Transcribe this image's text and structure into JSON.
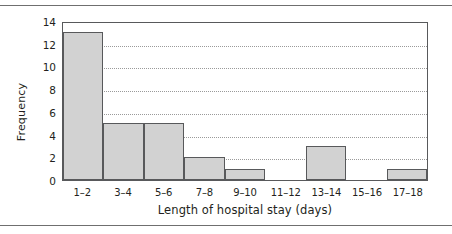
{
  "figure": {
    "background": "#ffffff",
    "rules": {
      "top": "#6f6f6f",
      "bottom": "#6f6f6f"
    }
  },
  "chart_data": {
    "type": "bar",
    "title": "",
    "subtitle": "",
    "xlabel": "Length of hospital stay (days)",
    "ylabel": "Frequency",
    "categories": [
      "1–2",
      "3–4",
      "5–6",
      "7–8",
      "9–10",
      "11–12",
      "13–14",
      "15–16",
      "17–18"
    ],
    "values": [
      13,
      5,
      5,
      2,
      1,
      0,
      3,
      0,
      1
    ],
    "ylim": [
      0,
      14
    ],
    "yticks": [
      14,
      12,
      10,
      8,
      6,
      4,
      2,
      0
    ],
    "ytick_labels": [
      "14",
      "12",
      "10",
      "8",
      "6",
      "4",
      "2",
      "0"
    ],
    "grid": true,
    "grid_style": "dotted",
    "grid_color": "#9a9a9a",
    "legend": false,
    "bar_fill": "#d2d2d2",
    "bar_edge": "#58595b",
    "frame_color": "#58595b",
    "contiguous_bars": true
  }
}
